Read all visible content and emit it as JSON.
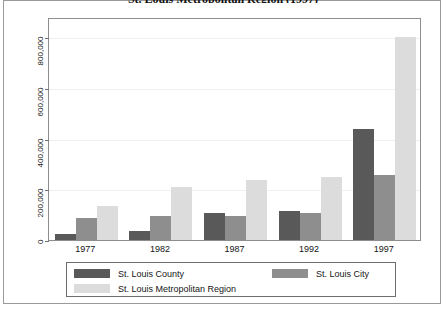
{
  "figure": {
    "title": "St. Louis Metropolitan Region (1997)"
  },
  "legend": {
    "entries": [
      {
        "label": "St. Louis County",
        "key": "county"
      },
      {
        "label": "St. Louis City",
        "key": "city"
      },
      {
        "label": "St. Louis Metropolitan Region",
        "key": "metro"
      }
    ]
  },
  "colors": {
    "county": "#595959",
    "city": "#8e8e8e",
    "metro": "#dcdcdc",
    "axis": "#8d8d8d",
    "grid": "#f0f0f0",
    "frame": "#9a9a9a"
  },
  "chart_data": {
    "type": "bar",
    "title": "St. Louis Metropolitan Region (1997)",
    "xlabel": "",
    "ylabel": "",
    "categories": [
      "1977",
      "1982",
      "1987",
      "1992",
      "1997"
    ],
    "series": [
      {
        "name": "St. Louis County",
        "values": [
          25000,
          37000,
          107000,
          115000,
          440000
        ]
      },
      {
        "name": "St. Louis City",
        "values": [
          87000,
          96000,
          95000,
          106000,
          255000
        ]
      },
      {
        "name": "St. Louis Metropolitan Region",
        "values": [
          136000,
          210000,
          237000,
          248000,
          800000
        ]
      }
    ],
    "ylim": [
      0,
      880000
    ],
    "yticks": [
      0,
      200000,
      400000,
      600000,
      800000
    ],
    "ytick_labels": [
      "0",
      "200,000",
      "400,000",
      "600,000",
      "800,000"
    ],
    "grid": true,
    "legend_position": "bottom"
  }
}
